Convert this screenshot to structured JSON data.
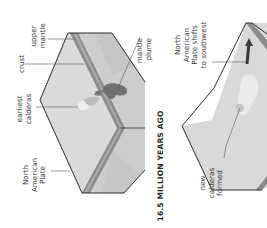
{
  "diagram": {
    "orientation": "rotated 90 degrees counterclockwise",
    "panel_1": {
      "title": "16.5 MILLION YEARS AGO",
      "labels": {
        "upper_mantle": [
          "upper",
          "mantle"
        ],
        "crust": [
          "crust"
        ],
        "mantle_plume": [
          "mantle",
          "plume"
        ],
        "earliest_calderas": [
          "earliest",
          "calderas"
        ],
        "north_american_plate": [
          "North",
          "American",
          "Plate"
        ]
      }
    },
    "panel_2": {
      "labels": {
        "plate_shift": [
          "North",
          "American",
          "Plate shifts",
          "to southwest"
        ],
        "new_calderas": [
          "new",
          "calderas",
          "formed"
        ]
      }
    },
    "colors": {
      "surface": "#d9d9d9",
      "mantle": "#cfcfcf",
      "crust_band": "#8a8a8a",
      "crust_highlight": "#a8a8a8",
      "plume": "#6e6e6e",
      "outline": "#2b2b2b",
      "text": "#3a3a3a"
    }
  }
}
